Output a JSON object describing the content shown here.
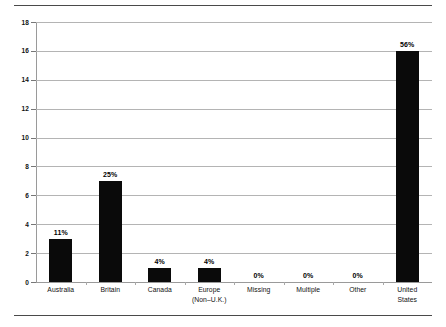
{
  "chart_data": {
    "type": "bar",
    "title": "",
    "subtitle": "",
    "xlabel": "",
    "ylabel": "",
    "ylim": [
      0,
      18
    ],
    "ytick_step": 2,
    "grid": true,
    "legend": false,
    "legend_position": "none",
    "bar_color": "#0a0a0a",
    "gridline_color": "#b4b4b4",
    "categories": [
      "Australia",
      "Britain",
      "Canada",
      "Europe (Non–U.K.)",
      "Missing",
      "Multiple",
      "Other",
      "United States"
    ],
    "category_lines": [
      [
        "Australia"
      ],
      [
        "Britain"
      ],
      [
        "Canada"
      ],
      [
        "Europe",
        "(Non–U.K.)"
      ],
      [
        "Missing"
      ],
      [
        "Multiple"
      ],
      [
        "Other"
      ],
      [
        "United",
        "States"
      ]
    ],
    "values": [
      3,
      7,
      1,
      1,
      0,
      0,
      0,
      16
    ],
    "data_labels": [
      "11%",
      "25%",
      "4%",
      "4%",
      "0%",
      "0%",
      "0%",
      "56%"
    ],
    "ytick_labels": [
      "0",
      "2",
      "4",
      "6",
      "8",
      "10",
      "12",
      "14",
      "16",
      "18"
    ],
    "ytick_values": [
      0,
      2,
      4,
      6,
      8,
      10,
      12,
      14,
      16,
      18
    ]
  },
  "decorations": {
    "top_rule": "horizontal-rule",
    "bottom_rule": "horizontal-rule"
  }
}
